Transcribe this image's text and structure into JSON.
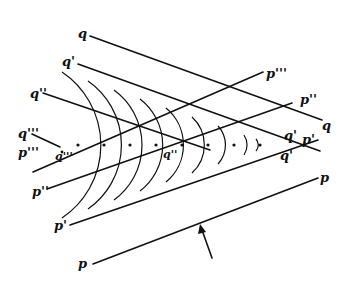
{
  "figure": {
    "labels": {
      "q_top": "q",
      "q_right": "q",
      "q1_left": "q'",
      "q1_apex_upper": "q'",
      "q1_apex_lower": "q'",
      "p1_apex": "p'",
      "q2_left": "q''",
      "q2_center": "q''",
      "q3_left": "q'''",
      "q3_center": "q'''",
      "p3_left": "p'''",
      "p3_right": "p'''",
      "p2_left": "p''",
      "p2_right": "p''",
      "p1_left": "p'",
      "p_left": "p",
      "p_right": "p"
    },
    "wavelet_centers_count": 8,
    "arrow": "propagation-direction-arrow"
  }
}
